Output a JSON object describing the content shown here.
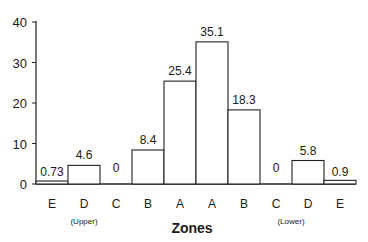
{
  "chart_data": {
    "type": "bar",
    "title": "",
    "xlabel": "Zones",
    "ylabel": "",
    "ylim": [
      0,
      40
    ],
    "yticks": [
      0,
      10,
      20,
      30,
      40
    ],
    "grid": false,
    "legend": null,
    "categories": [
      "E",
      "D",
      "C",
      "B",
      "A",
      "A",
      "B",
      "C",
      "D",
      "E"
    ],
    "values": [
      0.73,
      4.6,
      0,
      8.4,
      25.4,
      35.1,
      18.3,
      0,
      5.8,
      0.9
    ],
    "data_labels": [
      "0.73",
      "4.6",
      "0",
      "8.4",
      "25.4",
      "35.1",
      "18.3",
      "0",
      "5.8",
      "0.9"
    ],
    "group_labels": [
      {
        "text": "(Upper)",
        "under_categories": [
          0,
          1,
          2,
          3
        ]
      },
      {
        "text": "(Lower)",
        "under_categories": [
          6,
          7,
          8,
          9
        ]
      }
    ]
  },
  "axis": {
    "x_title": "Zones",
    "upper_label": "(Upper)",
    "lower_label": "(Lower)"
  }
}
